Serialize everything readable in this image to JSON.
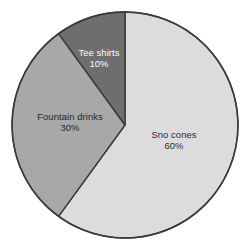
{
  "chart_data": {
    "type": "pie",
    "title": "",
    "subtitle": "",
    "xlabel": "",
    "ylabel": "",
    "legend_position": "none",
    "grid": false,
    "labels_inside": true,
    "start_angle_deg": 0,
    "direction": "clockwise",
    "categories": [
      "Sno cones",
      "Fountain drinks",
      "Tee shirts"
    ],
    "values": [
      60,
      30,
      10
    ],
    "value_unit": "%",
    "slices": [
      {
        "name": "Sno cones",
        "value": 60,
        "label": "Sno cones",
        "value_label": "60%",
        "color": "#dcdcdc",
        "text_color": "#2b2b2b"
      },
      {
        "name": "Fountain drinks",
        "value": 30,
        "label": "Fountain drinks",
        "value_label": "30%",
        "color": "#a8a8a8",
        "text_color": "#242424"
      },
      {
        "name": "Tee shirts",
        "value": 10,
        "label": "Tee shirts",
        "value_label": "10%",
        "color": "#6e6e6e",
        "text_color": "#ffffff"
      }
    ]
  },
  "figure": {
    "background_color": "#ffffff",
    "outline_color": "#3a3a3a",
    "center_x": 125,
    "center_y": 125,
    "radius": 113
  }
}
